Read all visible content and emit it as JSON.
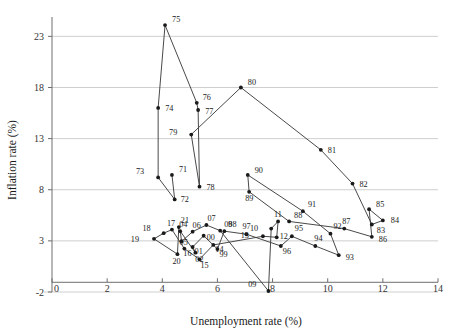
{
  "chart_data": {
    "type": "line",
    "title": "",
    "subtitle": "",
    "xlabel": "Unemployment rate (%)",
    "ylabel": "Inflation rate (%)",
    "xlim": [
      0,
      14
    ],
    "ylim": [
      -2,
      24.6
    ],
    "xticks": [
      0,
      2,
      4,
      6,
      8,
      10,
      12,
      14
    ],
    "xtick_labels": [
      "0",
      "2",
      "4",
      "6",
      "8",
      "10",
      "12",
      "14"
    ],
    "yticks": [
      -2,
      3,
      8,
      13,
      18,
      23
    ],
    "ytick_labels": [
      "-2",
      "3",
      "8",
      "13",
      "18",
      "23"
    ],
    "grid": "horizontal",
    "legend": "none",
    "marker": "filled-circle",
    "line_color": "#3f3f3f",
    "marker_color": "#1a1a1a",
    "grid_color": "#c9c9c9",
    "axis_color": "#6e6e6e",
    "connected": true,
    "series": [
      {
        "name": "Phillips curve path 1971-2021",
        "points": [
          {
            "label": "71",
            "x": 4.35,
            "y": 9.45,
            "lx": 7,
            "ly": -3
          },
          {
            "label": "72",
            "x": 4.45,
            "y": 7.05,
            "lx": 6,
            "ly": 3
          },
          {
            "label": "73",
            "x": 3.85,
            "y": 9.2,
            "lx": -14,
            "ly": -3
          },
          {
            "label": "74",
            "x": 3.85,
            "y": 16.0,
            "lx": 7,
            "ly": 3
          },
          {
            "label": "75",
            "x": 4.1,
            "y": 24.1,
            "lx": 7,
            "ly": -3
          },
          {
            "label": "76",
            "x": 5.25,
            "y": 16.5,
            "lx": 6,
            "ly": -3
          },
          {
            "label": "77",
            "x": 5.3,
            "y": 15.8,
            "lx": 7,
            "ly": 4
          },
          {
            "label": "78",
            "x": 5.35,
            "y": 8.3,
            "lx": 7,
            "ly": 3
          },
          {
            "label": "79",
            "x": 5.05,
            "y": 13.4,
            "lx": -14,
            "ly": 0
          },
          {
            "label": "80",
            "x": 6.85,
            "y": 18.0,
            "lx": 7,
            "ly": -2
          },
          {
            "label": "81",
            "x": 9.75,
            "y": 11.9,
            "lx": 7,
            "ly": 3
          },
          {
            "label": "82",
            "x": 10.9,
            "y": 8.6,
            "lx": 7,
            "ly": 3
          },
          {
            "label": "83",
            "x": 11.6,
            "y": 4.6,
            "lx": 5,
            "ly": 8
          },
          {
            "label": "84",
            "x": 12.0,
            "y": 5.0,
            "lx": 8,
            "ly": 3
          },
          {
            "label": "85",
            "x": 11.5,
            "y": 6.1,
            "lx": 7,
            "ly": -2
          },
          {
            "label": "86",
            "x": 11.6,
            "y": 3.4,
            "lx": 7,
            "ly": 5
          },
          {
            "label": "87",
            "x": 10.6,
            "y": 4.2,
            "lx": -2,
            "ly": -5
          },
          {
            "label": "88",
            "x": 8.6,
            "y": 4.9,
            "lx": 5,
            "ly": -3
          },
          {
            "label": "89",
            "x": 7.15,
            "y": 7.8,
            "lx": -4,
            "ly": 9
          },
          {
            "label": "90",
            "x": 7.1,
            "y": 9.45,
            "lx": 7,
            "ly": -2
          },
          {
            "label": "91",
            "x": 9.1,
            "y": 5.9,
            "lx": 5,
            "ly": -4
          },
          {
            "label": "92",
            "x": 10.1,
            "y": 3.7,
            "lx": 3,
            "ly": -5
          },
          {
            "label": "93",
            "x": 10.4,
            "y": 1.6,
            "lx": 7,
            "ly": 5
          },
          {
            "label": "94",
            "x": 9.55,
            "y": 2.5,
            "lx": -1,
            "ly": -5
          },
          {
            "label": "95",
            "x": 8.7,
            "y": 3.45,
            "lx": 3,
            "ly": -5
          },
          {
            "label": "96",
            "x": 8.3,
            "y": 2.5,
            "lx": 2,
            "ly": 8
          },
          {
            "label": "97",
            "x": 7.05,
            "y": 3.65,
            "lx": -4,
            "ly": -5
          },
          {
            "label": "98",
            "x": 6.25,
            "y": 3.95,
            "lx": 4,
            "ly": -4
          },
          {
            "label": "99",
            "x": 6.0,
            "y": 2.2,
            "lx": 2,
            "ly": 8
          },
          {
            "label": "00",
            "x": 5.5,
            "y": 3.5,
            "lx": 3,
            "ly": 4
          },
          {
            "label": "01",
            "x": 5.1,
            "y": 2.4,
            "lx": 2,
            "ly": 7
          },
          {
            "label": "02",
            "x": 5.2,
            "y": 1.85,
            "lx": 0,
            "ly": 9
          },
          {
            "label": "04",
            "x": 4.65,
            "y": 3.95,
            "lx": -1,
            "ly": -4
          },
          {
            "label": "05",
            "x": 4.7,
            "y": 2.95,
            "lx": -2,
            "ly": 4
          },
          {
            "label": "06",
            "x": 5.1,
            "y": 3.9,
            "lx": 0,
            "ly": -4
          },
          {
            "label": "07",
            "x": 5.6,
            "y": 4.55,
            "lx": 1,
            "ly": -4
          },
          {
            "label": "08",
            "x": 6.1,
            "y": 4.0,
            "lx": 4,
            "ly": -4
          },
          {
            "label": "09",
            "x": 7.85,
            "y": -1.9,
            "lx": -12,
            "ly": -4
          },
          {
            "label": "10",
            "x": 7.95,
            "y": 4.2,
            "lx": -13,
            "ly": 2
          },
          {
            "label": "11",
            "x": 8.2,
            "y": 4.9,
            "lx": -4,
            "ly": -4
          },
          {
            "label": "12",
            "x": 8.15,
            "y": 3.35,
            "lx": 3,
            "ly": 2
          },
          {
            "label": "13",
            "x": 7.65,
            "y": 3.45,
            "lx": -14,
            "ly": 2
          },
          {
            "label": "14",
            "x": 5.85,
            "y": 2.6,
            "lx": 2,
            "ly": 7
          },
          {
            "label": "15",
            "x": 5.35,
            "y": 1.2,
            "lx": 1,
            "ly": 9
          },
          {
            "label": "16",
            "x": 4.8,
            "y": 2.25,
            "lx": -1,
            "ly": 7
          },
          {
            "label": "17",
            "x": 4.35,
            "y": 4.1,
            "lx": -5,
            "ly": -4
          },
          {
            "label": "18",
            "x": 4.05,
            "y": 3.75,
            "lx": -13,
            "ly": -2
          },
          {
            "label": "19",
            "x": 3.7,
            "y": 3.2,
            "lx": -15,
            "ly": 3
          },
          {
            "label": "20",
            "x": 4.55,
            "y": 1.7,
            "lx": -5,
            "ly": 10
          },
          {
            "label": "21",
            "x": 4.6,
            "y": 4.35,
            "lx": 2,
            "ly": -4
          }
        ]
      }
    ]
  }
}
